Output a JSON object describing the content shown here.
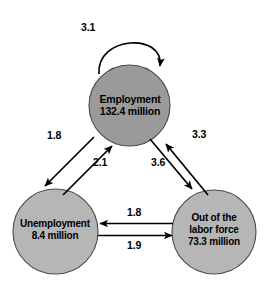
{
  "diagram": {
    "colors": {
      "employment_fill": "#9a9a9a",
      "unemployment_fill": "#b5b5b5",
      "out_of_labor_force_fill": "#b5b5b5",
      "node_stroke": "#3a3a3a",
      "arrow": "#000000",
      "background": "#ffffff",
      "text": "#000000"
    },
    "nodes": [
      {
        "id": "employment",
        "name": "Employment",
        "value_line": "132.4 million",
        "value": 132.4,
        "unit": "million",
        "fill": "#9a9a9a"
      },
      {
        "id": "unemployment",
        "name": "Unemployment",
        "value_line": "8.4 million",
        "value": 8.4,
        "unit": "million",
        "fill": "#b5b5b5"
      },
      {
        "id": "out-of-labor-force",
        "name_line1": "Out of the",
        "name_line2": "labor force",
        "value_line": "73.3 million",
        "value": 73.3,
        "unit": "million",
        "fill": "#b5b5b5"
      }
    ],
    "flows": [
      {
        "id": "employment-to-employment",
        "from": "Employment",
        "to": "Employment",
        "label": "3.1",
        "value": 3.1
      },
      {
        "id": "employment-to-unemployment",
        "from": "Employment",
        "to": "Unemployment",
        "label": "1.8",
        "value": 1.8
      },
      {
        "id": "unemployment-to-employment",
        "from": "Unemployment",
        "to": "Employment",
        "label": "2.1",
        "value": 2.1
      },
      {
        "id": "employment-to-out-of-labor-force",
        "from": "Employment",
        "to": "Out of the labor force",
        "label": "3.6",
        "value": 3.6
      },
      {
        "id": "out-of-labor-force-to-employment",
        "from": "Out of the labor force",
        "to": "Employment",
        "label": "3.3",
        "value": 3.3
      },
      {
        "id": "out-of-labor-force-to-unemployment",
        "from": "Out of the labor force",
        "to": "Unemployment",
        "label": "1.8",
        "value": 1.8
      },
      {
        "id": "unemployment-to-out-of-labor-force",
        "from": "Unemployment",
        "to": "Out of the labor force",
        "label": "1.9",
        "value": 1.9
      }
    ]
  }
}
